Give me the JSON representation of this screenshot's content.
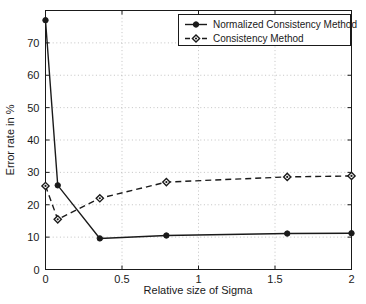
{
  "chart_data": {
    "type": "line",
    "title": "",
    "xlabel": "Relative size of Sigma",
    "ylabel": "Error rate in %",
    "xlim": [
      0,
      2
    ],
    "ylim": [
      0,
      80
    ],
    "xticks": [
      "0",
      "0.5",
      "1",
      "1.5",
      "2"
    ],
    "xtick_values": [
      0,
      0.5,
      1,
      1.5,
      2
    ],
    "yticks": [
      "0",
      "10",
      "20",
      "30",
      "40",
      "50",
      "60",
      "70"
    ],
    "ytick_values": [
      0,
      10,
      20,
      30,
      40,
      50,
      60,
      70
    ],
    "grid": true,
    "grid_style": "dotted",
    "legend_position": "top-right-inside",
    "x": [
      0,
      0.08,
      0.355,
      0.79,
      1.58,
      2
    ],
    "series": [
      {
        "name": "Normalized Consistency Method",
        "values": [
          77.0,
          26.0,
          9.6,
          10.5,
          11.1,
          11.2
        ],
        "line_style": "solid",
        "marker": "circle",
        "color": "#1a1a1a"
      },
      {
        "name": "Consistency Method",
        "values": [
          25.8,
          15.5,
          22.0,
          27.0,
          28.6,
          28.9
        ],
        "line_style": "dashed",
        "marker": "diamond",
        "color": "#1a1a1a"
      }
    ]
  },
  "legend": {
    "entries": [
      {
        "label": "Normalized Consistency Method"
      },
      {
        "label": "Consistency Method"
      }
    ]
  },
  "axes": {
    "x_title": "Relative size of Sigma",
    "y_title": "Error rate in %"
  },
  "colors": {
    "foreground": "#1a1a1a",
    "grid": "#b4b4b4",
    "background": "#ffffff"
  }
}
